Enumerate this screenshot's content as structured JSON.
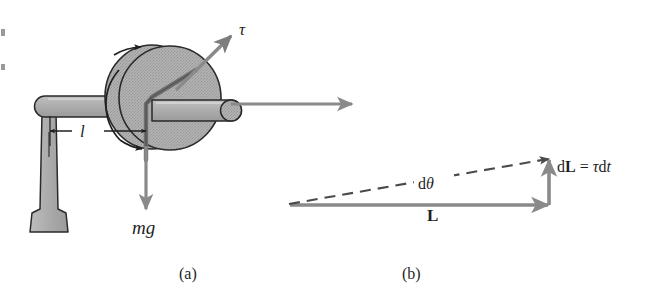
{
  "figure": {
    "panels": [
      {
        "id": "a",
        "caption": "(a)",
        "description": "Spinning wheel on a horizontal axle supported by a vertical stand",
        "labels": [
          {
            "name": "torque",
            "text": "τ"
          },
          {
            "name": "lever-arm",
            "text": "l"
          },
          {
            "name": "weight",
            "text": "mg"
          }
        ]
      },
      {
        "id": "b",
        "caption": "(b)",
        "description": "Vector diagram of angular momentum change",
        "labels": [
          {
            "name": "angular-momentum",
            "text": "L"
          },
          {
            "name": "angle-increment",
            "text": "dθ"
          },
          {
            "name": "momentum-increment",
            "text": "dL = τ dt"
          }
        ]
      }
    ],
    "equation": {
      "d_prefix": "d",
      "L_symbol": "L",
      "equals": "=",
      "tau_symbol": "τ",
      "dt_d": "d",
      "dt_t": "t"
    },
    "dtheta": {
      "d_prefix": "d",
      "theta_symbol": "θ"
    },
    "colors": {
      "background": "#ffffff",
      "ink": "#1f1f1f",
      "metal_fill": "#a9a9a9",
      "metal_fill_light": "#b4b4b4",
      "metal_stroke": "#2a2a2a",
      "vector_gray": "#8a8a8a",
      "vector_dark": "#7b7b7b",
      "dashed_gray": "#4a4a4a"
    }
  }
}
